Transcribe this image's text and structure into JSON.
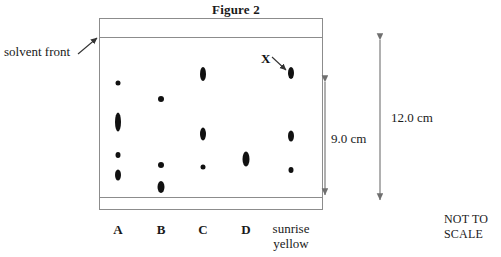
{
  "figure": {
    "title": "Figure 2",
    "not_to_scale": "NOT TO\nSCALE",
    "not_to_scale_line1": "NOT TO",
    "not_to_scale_line2": "SCALE"
  },
  "labels": {
    "solvent_front": "solvent front",
    "spot_marker": "X"
  },
  "dimensions": {
    "inner": "9.0 cm",
    "outer": "12.0 cm"
  },
  "lanes": [
    {
      "id": "A",
      "label": "A",
      "label_lines": [
        "A"
      ]
    },
    {
      "id": "B",
      "label": "B",
      "label_lines": [
        "B"
      ]
    },
    {
      "id": "C",
      "label": "C",
      "label_lines": [
        "C"
      ]
    },
    {
      "id": "D",
      "label": "D",
      "label_lines": [
        "D"
      ]
    },
    {
      "id": "sunrise-yellow",
      "label": "sunrise yellow",
      "label_lines": [
        "sunrise",
        "yellow"
      ]
    }
  ],
  "colors": {
    "spot": "#111111",
    "plate_border": "#8c8c8c",
    "text": "#1a1a1a",
    "background": "#ffffff"
  },
  "chart_data": {
    "type": "scatter",
    "title": "Figure 2",
    "subtitle": "Paper chromatogram of food colourings",
    "xlabel": "",
    "ylabel": "",
    "grid": false,
    "legend": false,
    "annotations": [
      {
        "text": "solvent front",
        "target": "solvent front line at top of plate"
      },
      {
        "text": "X",
        "target": "highest spot in sunrise yellow lane"
      },
      {
        "text": "9.0 cm",
        "meaning": "distance from baseline to solvent front"
      },
      {
        "text": "12.0 cm",
        "meaning": "full height of chromatography plate"
      },
      {
        "text": "NOT TO SCALE",
        "meaning": "diagram is not drawn to scale"
      }
    ],
    "axis_note": "Vertical axis is distance travelled up the plate from the baseline (cm).",
    "baseline_cm": 0.0,
    "solvent_front_cm": 9.0,
    "plate_height_cm": 12.0,
    "categories": [
      "A",
      "B",
      "C",
      "D",
      "sunrise yellow"
    ],
    "series": [
      {
        "name": "A",
        "lane_x_px": 118,
        "spot_count": 4,
        "spots": [
          {
            "y_px": 83,
            "rf": 0.88,
            "distance_cm": 7.9,
            "w": 5,
            "h": 5
          },
          {
            "y_px": 122,
            "rf": 0.58,
            "distance_cm": 5.2,
            "w": 6,
            "h": 19
          },
          {
            "y_px": 155,
            "rf": 0.33,
            "distance_cm": 3.0,
            "w": 5,
            "h": 6
          },
          {
            "y_px": 175,
            "rf": 0.18,
            "distance_cm": 1.6,
            "w": 6,
            "h": 11
          }
        ]
      },
      {
        "name": "B",
        "lane_x_px": 161,
        "spot_count": 3,
        "spots": [
          {
            "y_px": 99,
            "rf": 0.76,
            "distance_cm": 6.8,
            "w": 6,
            "h": 6
          },
          {
            "y_px": 165,
            "rf": 0.26,
            "distance_cm": 2.3,
            "w": 6,
            "h": 6
          },
          {
            "y_px": 187,
            "rf": 0.09,
            "distance_cm": 0.8,
            "w": 7,
            "h": 12
          }
        ]
      },
      {
        "name": "C",
        "lane_x_px": 203,
        "spot_count": 3,
        "spots": [
          {
            "y_px": 74,
            "rf": 0.95,
            "distance_cm": 8.6,
            "w": 6,
            "h": 14
          },
          {
            "y_px": 134,
            "rf": 0.5,
            "distance_cm": 4.5,
            "w": 6,
            "h": 13
          },
          {
            "y_px": 167,
            "rf": 0.24,
            "distance_cm": 2.2,
            "w": 5,
            "h": 5
          }
        ]
      },
      {
        "name": "D",
        "lane_x_px": 246,
        "spot_count": 1,
        "spots": [
          {
            "y_px": 159,
            "rf": 0.3,
            "distance_cm": 2.7,
            "w": 7,
            "h": 15
          }
        ]
      },
      {
        "name": "sunrise yellow",
        "lane_x_px": 291,
        "spot_count": 3,
        "spots": [
          {
            "y_px": 73,
            "rf": 0.95,
            "distance_cm": 8.6,
            "w": 6,
            "h": 12
          },
          {
            "y_px": 136,
            "rf": 0.48,
            "distance_cm": 4.3,
            "w": 6,
            "h": 11
          },
          {
            "y_px": 170,
            "rf": 0.22,
            "distance_cm": 2.0,
            "w": 5,
            "h": 6
          }
        ]
      }
    ]
  }
}
